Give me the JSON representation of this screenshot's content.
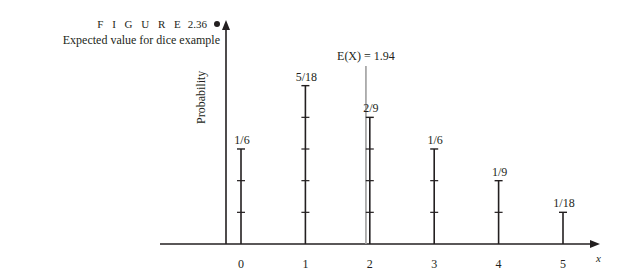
{
  "figure": {
    "label": "F I G U R E",
    "number": "2.36",
    "caption": "Expected value for dice example"
  },
  "chart_data": {
    "type": "bar",
    "style": "stem",
    "title": "Expected value for dice example",
    "xlabel": "x",
    "ylabel": "Probability",
    "categories": [
      "0",
      "1",
      "2",
      "3",
      "4",
      "5"
    ],
    "values": [
      0.1667,
      0.2778,
      0.2222,
      0.1667,
      0.1111,
      0.0556
    ],
    "value_labels": [
      "1/6",
      "5/18",
      "2/9",
      "1/6",
      "1/9",
      "1/18"
    ],
    "tick_marks_per_unit": "1/18",
    "annotations": [
      {
        "type": "vline",
        "x": 1.94,
        "label": "E(X) = 1.94",
        "color": "#9e9e9e"
      }
    ],
    "ylim": [
      0,
      0.33
    ],
    "grid": false,
    "legend": null
  },
  "colors": {
    "ink": "#231f20",
    "mean_line": "#9e9e9e"
  }
}
